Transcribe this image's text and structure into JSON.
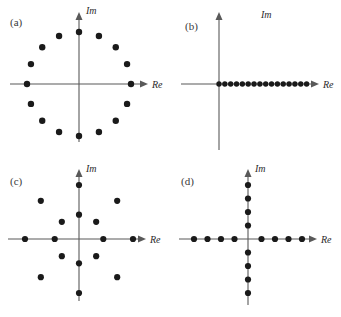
{
  "figure": {
    "background_color": "#ffffff",
    "point_color": "#1a1a1a",
    "axis_color": "#595959",
    "label_color": "#3a3a3a"
  },
  "panels": [
    {
      "id": "a",
      "label": "(a)",
      "axis_x_label": "Re",
      "axis_y_label": "Im",
      "constellation_type": "16-PSK",
      "point_count": 16,
      "description": "Sixteen points equally spaced on a single circle of constant amplitude."
    },
    {
      "id": "b",
      "label": "(b)",
      "axis_x_label": "Re",
      "axis_y_label": "Im",
      "constellation_type": "16-ASK",
      "point_count": 16,
      "description": "Sixteen points equally spaced along the positive real axis starting at the origin."
    },
    {
      "id": "c",
      "label": "(c)",
      "axis_x_label": "Re",
      "axis_y_label": "Im",
      "constellation_type": "16-APSK",
      "point_count": 16,
      "description": "Two concentric rings of eight points each, inner and outer, rotated in phase."
    },
    {
      "id": "d",
      "label": "(d)",
      "axis_x_label": "Re",
      "axis_y_label": "Im",
      "constellation_type": "16-point cross",
      "point_count": 16,
      "description": "Eight points along the real axis and eight points along the imaginary axis forming a cross."
    }
  ],
  "chart_data": {
    "type": "scatter",
    "xlabel": "Re",
    "ylabel": "Im",
    "xlim": [
      -1.35,
      1.35
    ],
    "ylim": [
      -1.35,
      1.35
    ],
    "grid": false,
    "legend": "none",
    "panels": [
      {
        "id": "a",
        "label": "(a)",
        "type": "16-PSK",
        "points": [
          {
            "re": 1.0,
            "im": 0.0
          },
          {
            "re": 0.924,
            "im": 0.383
          },
          {
            "re": 0.707,
            "im": 0.707
          },
          {
            "re": 0.383,
            "im": 0.924
          },
          {
            "re": 0.0,
            "im": 1.0
          },
          {
            "re": -0.383,
            "im": 0.924
          },
          {
            "re": -0.707,
            "im": 0.707
          },
          {
            "re": -0.924,
            "im": 0.383
          },
          {
            "re": -1.0,
            "im": 0.0
          },
          {
            "re": -0.924,
            "im": -0.383
          },
          {
            "re": -0.707,
            "im": -0.707
          },
          {
            "re": -0.383,
            "im": -0.924
          },
          {
            "re": 0.0,
            "im": -1.0
          },
          {
            "re": 0.383,
            "im": -0.924
          },
          {
            "re": 0.707,
            "im": -0.707
          },
          {
            "re": 0.924,
            "im": -0.383
          }
        ]
      },
      {
        "id": "b",
        "label": "(b)",
        "type": "16-ASK",
        "points": [
          {
            "re": 0.0,
            "im": 0.0
          },
          {
            "re": 0.08,
            "im": 0.0
          },
          {
            "re": 0.16,
            "im": 0.0
          },
          {
            "re": 0.24,
            "im": 0.0
          },
          {
            "re": 0.32,
            "im": 0.0
          },
          {
            "re": 0.4,
            "im": 0.0
          },
          {
            "re": 0.48,
            "im": 0.0
          },
          {
            "re": 0.56,
            "im": 0.0
          },
          {
            "re": 0.64,
            "im": 0.0
          },
          {
            "re": 0.72,
            "im": 0.0
          },
          {
            "re": 0.8,
            "im": 0.0
          },
          {
            "re": 0.88,
            "im": 0.0
          },
          {
            "re": 0.96,
            "im": 0.0
          },
          {
            "re": 1.04,
            "im": 0.0
          },
          {
            "re": 1.12,
            "im": 0.0
          },
          {
            "re": 1.2,
            "im": 0.0
          }
        ]
      },
      {
        "id": "c",
        "label": "(c)",
        "type": "16-APSK",
        "points": [
          {
            "re": 0.45,
            "im": 0.0
          },
          {
            "re": 0.318,
            "im": 0.318
          },
          {
            "re": 0.0,
            "im": 0.45
          },
          {
            "re": -0.318,
            "im": 0.318
          },
          {
            "re": -0.45,
            "im": 0.0
          },
          {
            "re": -0.318,
            "im": -0.318
          },
          {
            "re": 0.0,
            "im": -0.45
          },
          {
            "re": 0.318,
            "im": -0.318
          },
          {
            "re": 1.0,
            "im": 0.0
          },
          {
            "re": 0.707,
            "im": 0.707
          },
          {
            "re": 0.0,
            "im": 1.0
          },
          {
            "re": -0.707,
            "im": 0.707
          },
          {
            "re": -1.0,
            "im": 0.0
          },
          {
            "re": -0.707,
            "im": -0.707
          },
          {
            "re": 0.0,
            "im": -1.0
          },
          {
            "re": 0.707,
            "im": -0.707
          }
        ]
      },
      {
        "id": "d",
        "label": "(d)",
        "type": "16-point cross",
        "points": [
          {
            "re": 0.25,
            "im": 0.0
          },
          {
            "re": 0.5,
            "im": 0.0
          },
          {
            "re": 0.75,
            "im": 0.0
          },
          {
            "re": 1.0,
            "im": 0.0
          },
          {
            "re": -0.25,
            "im": 0.0
          },
          {
            "re": -0.5,
            "im": 0.0
          },
          {
            "re": -0.75,
            "im": 0.0
          },
          {
            "re": -1.0,
            "im": 0.0
          },
          {
            "re": 0.0,
            "im": 0.25
          },
          {
            "re": 0.0,
            "im": 0.5
          },
          {
            "re": 0.0,
            "im": 0.75
          },
          {
            "re": 0.0,
            "im": 1.0
          },
          {
            "re": 0.0,
            "im": -0.25
          },
          {
            "re": 0.0,
            "im": -0.5
          },
          {
            "re": 0.0,
            "im": -0.75
          },
          {
            "re": 0.0,
            "im": -1.0
          }
        ]
      }
    ]
  }
}
